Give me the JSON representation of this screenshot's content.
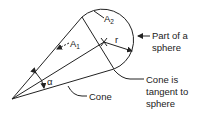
{
  "diagram": {
    "type": "cone tangent to partial sphere",
    "labels": {
      "A1": {
        "main": "A",
        "sub": "1"
      },
      "A2": {
        "main": "A",
        "sub": "2"
      },
      "r": "r",
      "alpha": "α",
      "part_of_sphere_line1": "Part of a",
      "part_of_sphere_line2": "sphere",
      "tangent_line1": "Cone is",
      "tangent_line2": "tangent to",
      "tangent_line3": "sphere",
      "cone": "Cone"
    },
    "geometry": {
      "apex": [
        12,
        99
      ],
      "sphere_center": [
        104,
        42
      ],
      "sphere_radius": 31,
      "upper_tangent_point": [
        82,
        17
      ],
      "lower_tangent_point": [
        114,
        69
      ]
    },
    "colors": {
      "stroke": "#222222",
      "background": "#ffffff"
    }
  }
}
